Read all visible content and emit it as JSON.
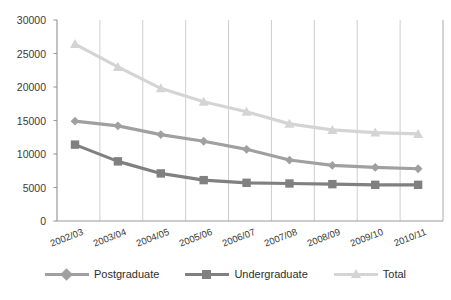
{
  "chart_data": {
    "type": "line",
    "title": "",
    "xlabel": "",
    "ylabel": "",
    "categories": [
      "2002/03",
      "2003/04",
      "2004/05",
      "2005/06",
      "2006/07",
      "2007/08",
      "2008/09",
      "2009/10",
      "2010/11"
    ],
    "ylim": [
      0,
      30000
    ],
    "ytick_values": [
      0,
      5000,
      10000,
      15000,
      20000,
      25000,
      30000
    ],
    "ytick_labels": [
      "0",
      "5000",
      "10000",
      "15000",
      "20000",
      "25000",
      "30000"
    ],
    "grid": "vertical-only",
    "legend_position": "bottom-center",
    "series": [
      {
        "name": "Postgraduate",
        "marker": "diamond",
        "color": "#a0a0a0",
        "values": [
          14900,
          14200,
          12900,
          11900,
          10700,
          9100,
          8300,
          8000,
          7800
        ]
      },
      {
        "name": "Undergraduate",
        "marker": "square",
        "color": "#808080",
        "values": [
          11400,
          8900,
          7100,
          6100,
          5700,
          5600,
          5500,
          5400,
          5400
        ]
      },
      {
        "name": "Total",
        "marker": "triangle",
        "color": "#d4d4d4",
        "values": [
          26400,
          23000,
          19800,
          17800,
          16300,
          14500,
          13600,
          13200,
          13000
        ]
      }
    ]
  },
  "legend": {
    "items": [
      {
        "label": "Postgraduate",
        "marker": "diamond-marker-icon",
        "color": "#a0a0a0"
      },
      {
        "label": "Undergraduate",
        "marker": "square-marker-icon",
        "color": "#808080"
      },
      {
        "label": "Total",
        "marker": "triangle-marker-icon",
        "color": "#d4d4d4"
      }
    ]
  },
  "axes": {
    "axis_color": "#9a9a9a",
    "gridline_color": "#bfbfbf"
  }
}
